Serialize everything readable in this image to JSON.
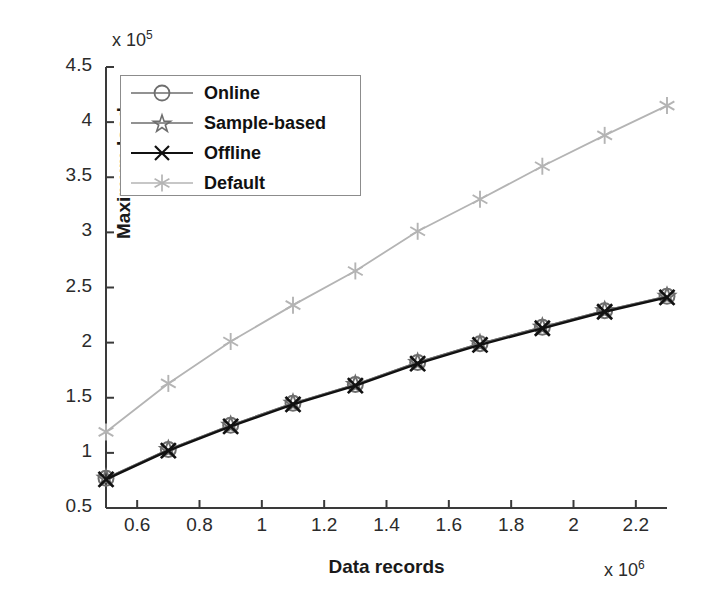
{
  "chart_data": {
    "type": "line",
    "title": "",
    "xlabel": "Data records",
    "ylabel": "Maximum load",
    "x_multiplier": "x 10",
    "x_exponent": "6",
    "y_multiplier": "x 10",
    "y_exponent": "5",
    "xlim": [
      0.5,
      2.3
    ],
    "ylim": [
      0.5,
      4.5
    ],
    "xticks": [
      "0.6",
      "0.8",
      "1",
      "1.2",
      "1.4",
      "1.6",
      "1.8",
      "2",
      "2.2"
    ],
    "xtick_values": [
      0.6,
      0.8,
      1.0,
      1.2,
      1.4,
      1.6,
      1.8,
      2.0,
      2.2
    ],
    "yticks": [
      "0.5",
      "1",
      "1.5",
      "2",
      "2.5",
      "3",
      "3.5",
      "4",
      "4.5"
    ],
    "ytick_values": [
      0.5,
      1.0,
      1.5,
      2.0,
      2.5,
      3.0,
      3.5,
      4.0,
      4.5
    ],
    "grid": false,
    "legend_position": "upper-left",
    "x": [
      0.5,
      0.7,
      0.9,
      1.1,
      1.3,
      1.5,
      1.7,
      1.9,
      2.1,
      2.3
    ],
    "series": [
      {
        "name": "Online",
        "marker": "circle",
        "color": "#6e6e6e",
        "values": [
          0.77,
          1.03,
          1.25,
          1.45,
          1.62,
          1.82,
          1.99,
          2.14,
          2.29,
          2.42
        ]
      },
      {
        "name": "Sample-based",
        "marker": "star",
        "color": "#6e6e6e",
        "values": [
          0.77,
          1.03,
          1.25,
          1.45,
          1.62,
          1.82,
          1.99,
          2.14,
          2.29,
          2.42
        ]
      },
      {
        "name": "Offline",
        "marker": "x",
        "color": "#111111",
        "values": [
          0.76,
          1.02,
          1.24,
          1.44,
          1.61,
          1.81,
          1.98,
          2.13,
          2.28,
          2.41
        ]
      },
      {
        "name": "Default",
        "marker": "asterisk",
        "color": "#b4b4b4",
        "values": [
          1.19,
          1.63,
          2.01,
          2.34,
          2.65,
          3.01,
          3.3,
          3.6,
          3.88,
          4.15
        ]
      }
    ]
  },
  "legend": {
    "items": [
      {
        "label": "Online"
      },
      {
        "label": "Sample-based"
      },
      {
        "label": "Offline"
      },
      {
        "label": "Default"
      }
    ]
  },
  "axis": {
    "x_title": "Data records",
    "y_title": "Maximum load"
  }
}
